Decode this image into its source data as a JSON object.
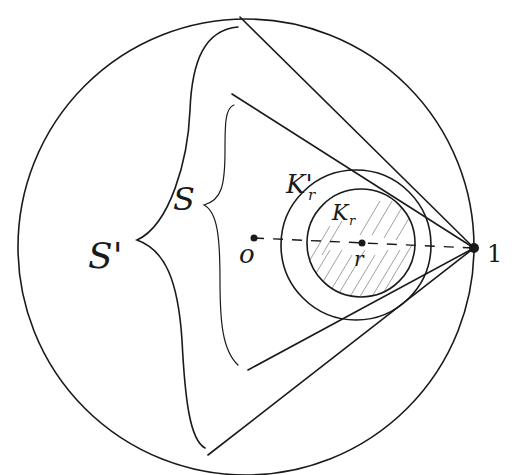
{
  "diagram": {
    "title": "",
    "labels": {
      "outer_region": "S'",
      "inner_region": "S",
      "outer_circle": "K'",
      "outer_circle_sub": "r",
      "inner_circle": "K",
      "inner_circle_sub": "r",
      "origin": "o",
      "center": "r",
      "boundary_point": "1"
    },
    "elements": [
      {
        "name": "unit-circle",
        "kind": "circle"
      },
      {
        "name": "disc-K-r-prime",
        "kind": "circle"
      },
      {
        "name": "disc-K-r",
        "kind": "circle",
        "hatched": true
      },
      {
        "name": "diameter-line",
        "kind": "dashed-line",
        "from": "o",
        "to": "1"
      },
      {
        "name": "tangent-lines-S-prime",
        "kind": "line-pair",
        "vertex": "1"
      },
      {
        "name": "tangent-lines-S",
        "kind": "line-pair",
        "vertex": "1"
      },
      {
        "name": "brace-S-prime",
        "kind": "brace"
      },
      {
        "name": "brace-S",
        "kind": "brace"
      }
    ],
    "colors": {
      "ink": "#1a1a1a",
      "background": "#ffffff",
      "hatch": "#555555"
    }
  }
}
